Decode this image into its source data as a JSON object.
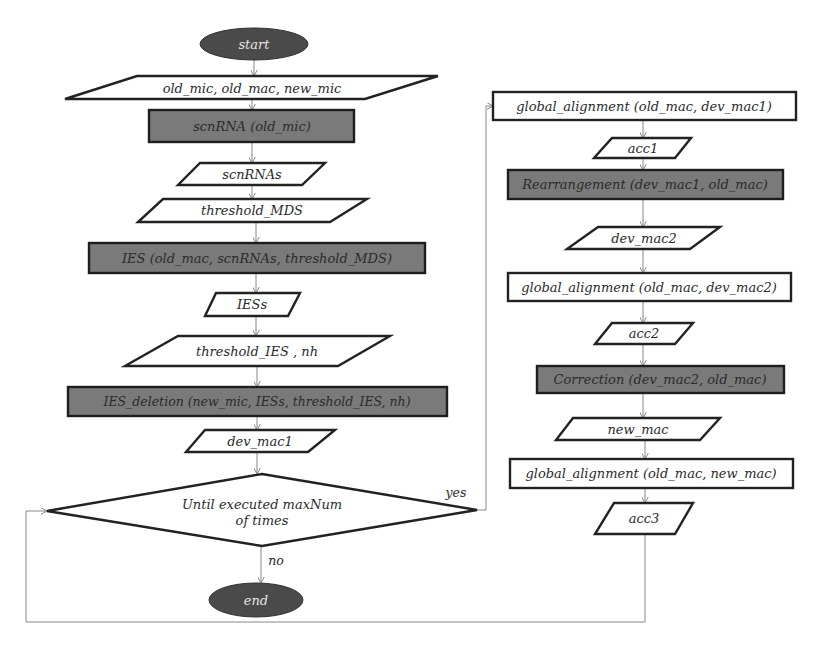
{
  "flowchart": {
    "start": {
      "label": "start"
    },
    "end": {
      "label": "end"
    },
    "left_column": {
      "inputs_main": {
        "label": "old_mic, old_mac, new_mic"
      },
      "proc_scnrna": {
        "label": "scnRNA (old_mic)"
      },
      "data_scnrnas": {
        "label": "scnRNAs"
      },
      "data_threshold_mds": {
        "label": "threshold_MDS"
      },
      "proc_ies": {
        "label": "IES (old_mac, scnRNAs, threshold_MDS)"
      },
      "data_iess": {
        "label": "IESs"
      },
      "data_threshold_ies": {
        "label": "threshold_IES , nh"
      },
      "proc_ies_deletion": {
        "label": "IES_deletion (new_mic, IESs, threshold_IES, nh)"
      },
      "data_dev_mac1": {
        "label": "dev_mac1"
      }
    },
    "decision": {
      "line1": "Until executed maxNum",
      "line2": "of times",
      "yes_label": "yes",
      "no_label": "no"
    },
    "right_column": {
      "proc_global_alignment_1": {
        "label": "global_alignment (old_mac, dev_mac1)"
      },
      "data_acc1": {
        "label": "acc1"
      },
      "proc_rearrangement": {
        "label": "Rearrangement (dev_mac1, old_mac)"
      },
      "data_dev_mac2": {
        "label": "dev_mac2"
      },
      "proc_global_alignment_2": {
        "label": "global_alignment (old_mac, dev_mac2)"
      },
      "data_acc2": {
        "label": "acc2"
      },
      "proc_correction": {
        "label": "Correction (dev_mac2, old_mac)"
      },
      "data_new_mac": {
        "label": "new_mac"
      },
      "proc_global_alignment_3": {
        "label": "global_alignment (old_mac, new_mac)"
      },
      "data_acc3": {
        "label": "acc3"
      }
    },
    "colors": {
      "terminal_fill": "#4a4a4a",
      "process_dark_fill": "#7a7a7a",
      "process_light_fill": "#ffffff",
      "stroke": "#222222",
      "connector": "#888888"
    }
  }
}
